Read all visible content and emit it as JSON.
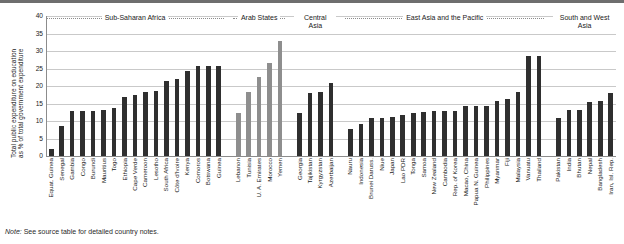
{
  "figure": {
    "note_prefix": "Note:",
    "note_text": " See source table for detailed country notes.",
    "ylabel_line1": "Total public expenditure on education",
    "ylabel_line2": "as % of total government expenditure"
  },
  "chart_data": {
    "type": "bar",
    "title": "",
    "xlabel": "",
    "ylabel": "Total public expenditure on education as % of total government expenditure",
    "ylim": [
      0,
      40
    ],
    "yticks": [
      0,
      5,
      10,
      15,
      20,
      25,
      30,
      35,
      40
    ],
    "grid": true,
    "legend": "none",
    "colors": {
      "dark_bar": "#2f2f2f",
      "light_bar": "#8e8e8e",
      "grid": "#c9c9c9",
      "axis": "#8c8c8c"
    },
    "groups": [
      {
        "name": "Sub-Saharan Africa",
        "color": "dark_bar",
        "categories": [
          "Equat. Guinea",
          "Senegal",
          "Gambia",
          "Congo",
          "Burundi",
          "Mauritius",
          "Togo",
          "Ethiopia",
          "Cape Verde",
          "Cameroon",
          "Lesotho",
          "South Africa",
          "Côte d'Ivoire",
          "Kenya",
          "Comoros",
          "Botswana",
          "Guinea"
        ],
        "values": [
          2.0,
          8.6,
          12.8,
          12.8,
          13.0,
          13.2,
          13.6,
          16.9,
          17.3,
          18.4,
          18.6,
          21.5,
          22.1,
          24.2,
          25.7,
          25.7,
          25.7
        ]
      },
      {
        "name": "Arab States",
        "color": "light_bar",
        "categories": [
          "Lebanon",
          "Tunisia",
          "U. A. Emirates",
          "Morocco",
          "Yemen"
        ],
        "values": [
          12.3,
          18.2,
          22.5,
          26.6,
          32.8
        ]
      },
      {
        "name": "Central Asia",
        "color": "dark_bar",
        "categories": [
          "Georgia",
          "Tajikistan",
          "Kyrgyzstan",
          "Azerbaijan"
        ],
        "values": [
          12.2,
          17.9,
          18.4,
          20.8
        ]
      },
      {
        "name": "East Asia and the Pacific",
        "color": "dark_bar",
        "categories": [
          "Nauru",
          "Indonesia",
          "Brunei Daruss.",
          "Niue",
          "Japan",
          "Lao PDR",
          "Tonga",
          "Samoa",
          "New Zealand",
          "Cambodia",
          "Rep. of Korea",
          "Macao, China",
          "Papua N. Guinea",
          "Philippines",
          "Myanmar",
          "Fiji",
          "Malaysia",
          "Vanuatu",
          "Thailand"
        ],
        "values": [
          7.6,
          9.1,
          10.9,
          10.9,
          11.2,
          11.7,
          12.3,
          12.7,
          13.0,
          13.0,
          13.0,
          14.4,
          14.4,
          14.4,
          15.6,
          16.4,
          18.2,
          28.5,
          28.5
        ]
      },
      {
        "name": "South and West Asia",
        "color": "dark_bar",
        "categories": [
          "Pakistan",
          "India",
          "Bhutan",
          "Nepal",
          "Bangladesh",
          "Iran, Isl. Rep."
        ],
        "values": [
          10.8,
          13.1,
          13.1,
          15.3,
          15.8,
          17.9
        ]
      }
    ]
  }
}
